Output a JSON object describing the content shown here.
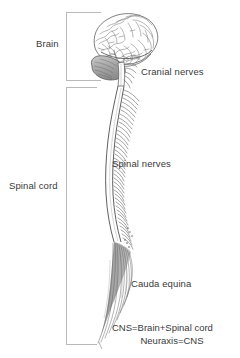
{
  "figure": {
    "background_color": "#ffffff",
    "ink_color": "#3a3a3a",
    "bracket_color": "#b9b9b9",
    "shade_color": "#9a9a9a",
    "width": 240,
    "height": 358
  },
  "labels": {
    "brain": "Brain",
    "spinal_cord": "Spinal cord",
    "cranial_nerves": "Cranial nerves",
    "spinal_nerves": "Spinal nerves",
    "cauda_equina": "Cauda equina"
  },
  "caption": {
    "line1": "CNS=Brain+Spinal cord",
    "line2": "Neuraxis=CNS"
  },
  "brackets": {
    "brain_bracket": "brain-region-bracket",
    "spinal_cord_bracket": "spinal-cord-region-bracket"
  },
  "anatomy": {
    "cerebrum": "cerebrum-lateral-view",
    "cerebellum": "cerebellum",
    "brainstem": "brainstem",
    "spinal_cord": "spinal-cord",
    "nerve_roots": "spinal-nerve-roots",
    "cauda_equina": "cauda-equina-fibers"
  }
}
